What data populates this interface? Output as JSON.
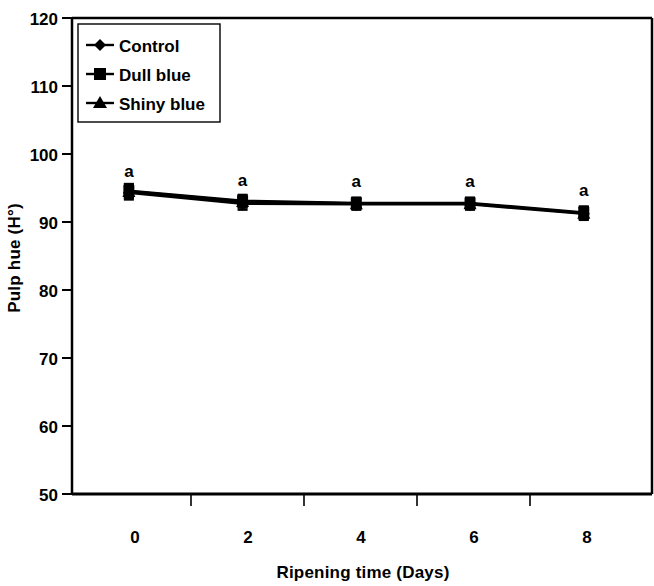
{
  "chart_data": {
    "type": "line",
    "title": "",
    "subtitle": "",
    "xlabel": "Ripening time (Days)",
    "ylabel": "Pulp hue (H°)",
    "x": [
      0,
      2,
      4,
      6,
      8
    ],
    "xtick_labels": [
      "0",
      "2",
      "4",
      "6",
      "8"
    ],
    "ytick_labels": [
      "50",
      "60",
      "70",
      "80",
      "90",
      "100",
      "110",
      "120"
    ],
    "yticks": [
      50,
      60,
      70,
      80,
      90,
      100,
      110,
      120
    ],
    "xlim": [
      -1,
      9.2
    ],
    "ylim": [
      50,
      120
    ],
    "grid": false,
    "legend_position": "top-left",
    "series": [
      {
        "name": "Control",
        "marker": "diamond",
        "color": "#000000",
        "values": [
          94.3,
          92.7,
          92.6,
          92.6,
          91.2
        ],
        "errors": [
          1.0,
          0.9,
          0.8,
          0.8,
          0.9
        ]
      },
      {
        "name": "Dull blue",
        "marker": "square",
        "color": "#000000",
        "values": [
          94.6,
          93.1,
          92.8,
          92.8,
          91.4
        ],
        "errors": [
          1.0,
          0.9,
          0.8,
          0.8,
          0.9
        ]
      },
      {
        "name": "Shiny blue",
        "marker": "triangle",
        "color": "#000000",
        "values": [
          94.5,
          93.0,
          92.7,
          92.7,
          91.3
        ],
        "errors": [
          1.0,
          0.9,
          0.8,
          0.8,
          0.9
        ]
      }
    ],
    "annotations": [
      {
        "x": 0,
        "y": 96.6,
        "text": "a"
      },
      {
        "x": 2,
        "y": 95.3,
        "text": "a"
      },
      {
        "x": 4,
        "y": 95.1,
        "text": "a"
      },
      {
        "x": 6,
        "y": 95.1,
        "text": "a"
      },
      {
        "x": 8,
        "y": 93.8,
        "text": "a"
      }
    ]
  },
  "legend": {
    "items": [
      {
        "label": "Control"
      },
      {
        "label": "Dull blue"
      },
      {
        "label": "Shiny blue"
      }
    ]
  },
  "axes": {
    "y_title": "Pulp hue (H°)",
    "x_title": "Ripening time (Days)",
    "y_ticks": [
      "120",
      "110",
      "100",
      "90",
      "80",
      "70",
      "60",
      "50"
    ],
    "x_ticks": [
      "0",
      "2",
      "4",
      "6",
      "8"
    ]
  }
}
